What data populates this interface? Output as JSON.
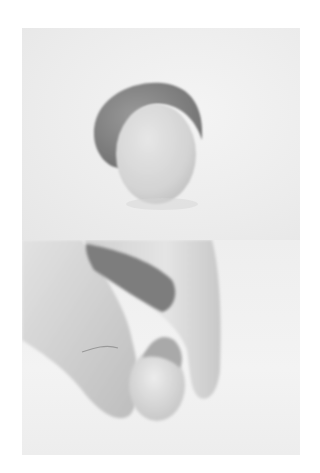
{
  "image": {
    "description": "Two stacked black-and-white instructional photographs showing clay sculpting steps",
    "panels": [
      {
        "id": "top",
        "subject": "Pale egg-shaped clay ball resting on a darker crescent-shaped clay piece"
      },
      {
        "id": "bottom",
        "subject": "Hand pinching and wrapping the darker clay around the pale clay ball"
      }
    ],
    "colors": {
      "background": "#ffffff",
      "backdrop": "#ececec",
      "dark_clay": "#8a8a8a",
      "light_clay": "#d9d9d9",
      "skin": "#d2d2d2"
    }
  }
}
